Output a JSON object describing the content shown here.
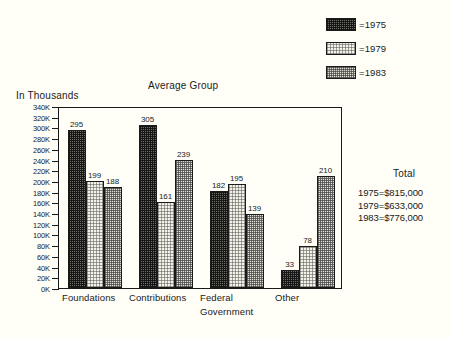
{
  "chart_data": {
    "type": "bar",
    "title": "Average Group",
    "ylabel": "In Thousands",
    "xlabel": "",
    "grid": false,
    "legend_position": "top-right",
    "ylim": [
      0,
      340
    ],
    "ytick_step": 20,
    "ytick_labels": [
      "340K",
      "320K",
      "300K",
      "280K",
      "260K",
      "240K",
      "220K",
      "200K",
      "180K",
      "160K",
      "140K",
      "120K",
      "100K",
      "80K",
      "60K",
      "40K",
      "20K",
      "0K"
    ],
    "ytick_values": [
      340,
      320,
      300,
      280,
      260,
      240,
      220,
      200,
      180,
      160,
      140,
      120,
      100,
      80,
      60,
      40,
      20,
      0
    ],
    "categories": [
      "Foundations",
      "Contributions",
      "Federal Government",
      "Other"
    ],
    "category_lines": [
      [
        "Foundations"
      ],
      [
        "Contributions"
      ],
      [
        "Federal",
        "Government"
      ],
      [
        "Other"
      ]
    ],
    "series": [
      {
        "name": "1975",
        "legend_label": "=1975",
        "pattern": "dark-dense-checker",
        "values": [
          295,
          305,
          182,
          33
        ]
      },
      {
        "name": "1979",
        "legend_label": "=1979",
        "pattern": "light-sparse-dots",
        "values": [
          199,
          161,
          195,
          78
        ]
      },
      {
        "name": "1983",
        "legend_label": "=1983",
        "pattern": "medium-checker",
        "values": [
          188,
          239,
          139,
          210
        ]
      }
    ],
    "units_note": "Values are in thousands of dollars"
  },
  "legend": {
    "items": [
      {
        "label": "=1975",
        "swatch": "pat-1975"
      },
      {
        "label": "=1979",
        "swatch": "pat-1979"
      },
      {
        "label": "=1983",
        "swatch": "pat-1983"
      }
    ]
  },
  "totals": {
    "heading": "Total",
    "rows": [
      "1975=$815,000",
      "1979=$633,000",
      "1983=$776,000"
    ]
  },
  "colors": {
    "background": "#fffef7",
    "ink": "#1a1a1a",
    "series_1975": "#6f6d68",
    "series_1979": "#f4f2e8",
    "series_1983": "#e2e0d6"
  }
}
